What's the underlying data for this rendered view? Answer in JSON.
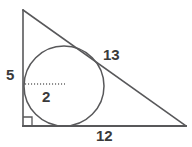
{
  "figure": {
    "background_color": "#ffffff",
    "stroke_color": "#58585a",
    "text_color": "#3a3a3a"
  },
  "triangle": {
    "vertices": {
      "apex": {
        "x": 23,
        "y": 10
      },
      "right_angle": {
        "x": 23,
        "y": 126
      },
      "base_right": {
        "x": 186,
        "y": 126
      }
    },
    "right_angle_marker": {
      "present": true,
      "size": 9,
      "at_vertex": "right_angle"
    }
  },
  "circle": {
    "center": {
      "x": 64,
      "y": 86
    },
    "radius": 40,
    "inscribed": true
  },
  "radius_line": {
    "style": "dotted",
    "from": {
      "x": 25,
      "y": 84
    },
    "to": {
      "x": 65,
      "y": 84
    }
  },
  "labels": {
    "vertical_leg": "5",
    "radius": "2",
    "hypotenuse": "13",
    "base": "12"
  }
}
